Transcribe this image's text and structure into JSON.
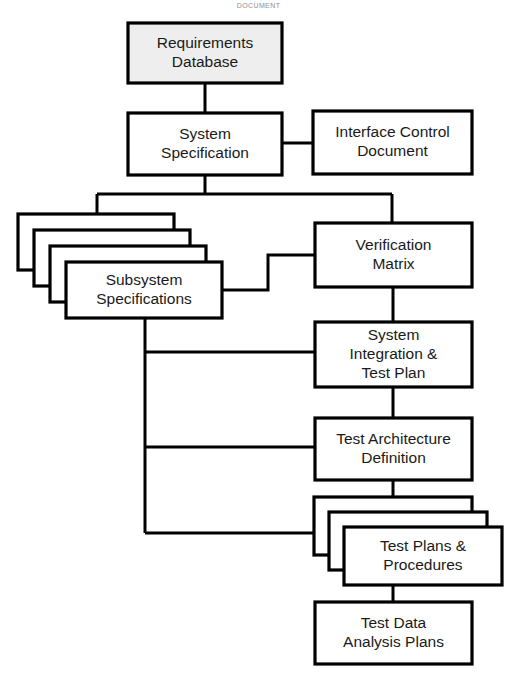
{
  "header": {
    "caption": "DOCUMENT"
  },
  "diagram": {
    "type": "flowchart",
    "background_color": "#ffffff",
    "line_color": "#000000",
    "fill_default": "#ffffff",
    "fill_highlight": "#eeeeee"
  },
  "nodes": [
    {
      "id": "requirements-database",
      "label_line1": "Requirements",
      "label_line2": "Database",
      "x": 128,
      "y": 23,
      "w": 154,
      "h": 60,
      "filled": true,
      "stacked": false
    },
    {
      "id": "system-specification",
      "label_line1": "System",
      "label_line2": "Specification",
      "x": 128,
      "y": 113,
      "w": 154,
      "h": 62,
      "filled": false,
      "stacked": false
    },
    {
      "id": "interface-control-document",
      "label_line1": "Interface Control",
      "label_line2": "Document",
      "x": 313,
      "y": 111,
      "w": 159,
      "h": 63,
      "filled": false,
      "stacked": false
    },
    {
      "id": "subsystem-specifications",
      "label_line1": "Subsystem",
      "label_line2": "Specifications",
      "x": 66,
      "y": 262,
      "w": 156,
      "h": 56,
      "filled": false,
      "stacked": true,
      "stack_count": 4,
      "stack_offset": 16
    },
    {
      "id": "verification-matrix",
      "label_line1": "Verification",
      "label_line2": "Matrix",
      "x": 315,
      "y": 223,
      "w": 157,
      "h": 64,
      "filled": false,
      "stacked": false
    },
    {
      "id": "system-integration-test-plan",
      "label_line1": "System",
      "label_line2": "Integration &",
      "label_line3": "Test Plan",
      "x": 315,
      "y": 322,
      "w": 157,
      "h": 65,
      "filled": false,
      "stacked": false
    },
    {
      "id": "test-architecture-definition",
      "label_line1": "Test Architecture",
      "label_line2": "Definition",
      "x": 315,
      "y": 418,
      "w": 157,
      "h": 62,
      "filled": false,
      "stacked": false
    },
    {
      "id": "test-plans-procedures",
      "label_line1": "Test Plans &",
      "label_line2": "Procedures",
      "x": 344,
      "y": 527,
      "w": 158,
      "h": 58,
      "filled": false,
      "stacked": true,
      "stack_count": 3,
      "stack_offset": 15
    },
    {
      "id": "test-data-analysis-plans",
      "label_line1": "Test Data",
      "label_line2": "Analysis Plans",
      "x": 315,
      "y": 602,
      "w": 157,
      "h": 62,
      "filled": false,
      "stacked": false
    }
  ],
  "connectors": [
    {
      "id": "requirements-to-system-spec",
      "from": "requirements-database",
      "to": "system-specification",
      "path": "M 205 83 L 205 113"
    },
    {
      "id": "system-spec-to-interface-control",
      "from": "system-specification",
      "to": "interface-control-document",
      "path": "M 282 143 L 313 143"
    },
    {
      "id": "system-spec-bus-drop",
      "from": "system-specification",
      "to": "bus",
      "path": "M 205 175 L 205 194"
    },
    {
      "id": "horizontal-distribution-bus",
      "from": "bus",
      "to": "subsystem-and-verification",
      "path": "M 97 194 L 392 194"
    },
    {
      "id": "bus-to-subsystem-stack",
      "from": "bus",
      "to": "subsystem-specifications",
      "path": "M 97 194 L 97 213"
    },
    {
      "id": "bus-to-verification-matrix",
      "from": "bus",
      "to": "verification-matrix",
      "path": "M 392 194 L 392 223"
    },
    {
      "id": "subsystem-to-verification-step",
      "from": "subsystem-specifications",
      "to": "verification-matrix",
      "path": "M 222 290 L 268 290 L 268 255 L 315 255"
    },
    {
      "id": "subsystem-spine-drop",
      "from": "subsystem-specifications",
      "to": "left-spine",
      "path": "M 145 318 L 145 533"
    },
    {
      "id": "spine-to-system-integration",
      "from": "left-spine",
      "to": "system-integration-test-plan",
      "path": "M 145 352 L 315 352"
    },
    {
      "id": "spine-to-test-architecture",
      "from": "left-spine",
      "to": "test-architecture-definition",
      "path": "M 145 447 L 315 447"
    },
    {
      "id": "spine-to-test-plans",
      "from": "left-spine",
      "to": "test-plans-procedures",
      "path": "M 145 533 L 329 533"
    },
    {
      "id": "verification-to-system-integration",
      "from": "verification-matrix",
      "to": "system-integration-test-plan",
      "path": "M 393 287 L 393 322"
    },
    {
      "id": "system-integration-to-test-architecture",
      "from": "system-integration-test-plan",
      "to": "test-architecture-definition",
      "path": "M 393 387 L 393 418"
    },
    {
      "id": "test-architecture-to-test-plans",
      "from": "test-architecture-definition",
      "to": "test-plans-procedures",
      "path": "M 393 480 L 393 503"
    },
    {
      "id": "test-plans-to-test-data-analysis",
      "from": "test-plans-procedures",
      "to": "test-data-analysis-plans",
      "path": "M 393 585 L 393 602"
    }
  ]
}
